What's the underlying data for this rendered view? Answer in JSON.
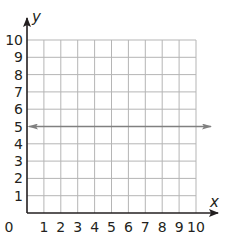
{
  "chart_data": {
    "type": "line",
    "title": "",
    "xlabel": "x",
    "ylabel": "y",
    "xlim": [
      0,
      10
    ],
    "ylim": [
      0,
      10
    ],
    "grid": true,
    "x_ticks": [
      "0",
      "1",
      "2",
      "3",
      "4",
      "5",
      "6",
      "7",
      "8",
      "9",
      "10"
    ],
    "y_ticks": [
      "1",
      "2",
      "3",
      "4",
      "5",
      "6",
      "7",
      "8",
      "9",
      "10"
    ],
    "origin_label": "0",
    "series": [
      {
        "name": "y = 5",
        "description": "horizontal line with arrows at both ends",
        "x": [
          0,
          10
        ],
        "y": [
          5,
          5
        ],
        "extends_beyond_grid": true
      }
    ],
    "legend": null
  },
  "colors": {
    "axis": "#231f20",
    "grid": "#b5b5b5",
    "line": "#808080"
  },
  "layout": {
    "origin_px": [
      27,
      213
    ],
    "cell_px": 16.9,
    "grid_right_px": 196,
    "grid_top_px": 40
  }
}
